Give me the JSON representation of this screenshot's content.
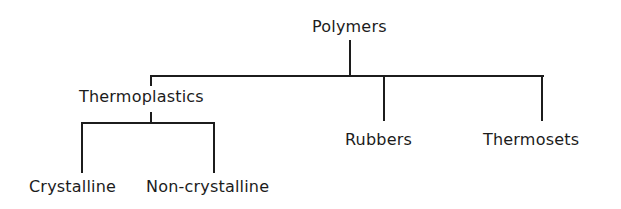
{
  "diagram": {
    "type": "tree",
    "root": {
      "label": "Polymers",
      "children": [
        {
          "label": "Thermoplastics",
          "children": [
            {
              "label": "Crystalline"
            },
            {
              "label": "Non-crystalline"
            }
          ]
        },
        {
          "label": "Rubbers"
        },
        {
          "label": "Thermosets"
        }
      ]
    }
  },
  "nodes": {
    "polymers": "Polymers",
    "thermoplastics": "Thermoplastics",
    "rubbers": "Rubbers",
    "thermosets": "Thermosets",
    "crystalline": "Crystalline",
    "non_crystalline": "Non-crystalline"
  },
  "colors": {
    "line": "#1c1c1c",
    "text": "#1c1c1c",
    "background": "#ffffff"
  }
}
